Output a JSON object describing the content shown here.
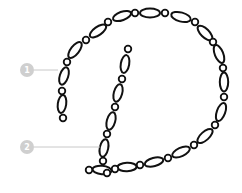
{
  "diagram": {
    "colors": {
      "chain": "#111111",
      "fill": "#ffffff",
      "callout": "#cfcfcf",
      "leader": "#c8c8c8",
      "background": "#ffffff"
    },
    "callouts": [
      {
        "label": "1",
        "target": "outer-arc-stroke"
      },
      {
        "label": "2",
        "target": "inner-stem-stroke"
      }
    ]
  }
}
